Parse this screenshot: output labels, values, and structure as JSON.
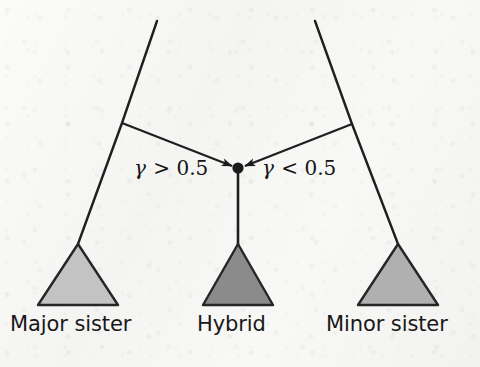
{
  "figure": {
    "background_color": "#f5f5f4",
    "ink_color": "#1b1b1b"
  },
  "network": {
    "hybrid_node": {
      "name": "hybrid-node",
      "x": 238,
      "y": 168,
      "radius": 5.5,
      "color": "#1b1b1b"
    },
    "lineages": [
      {
        "name": "major-sister-lineage",
        "points": "157,21 122,123 78,244",
        "top_x": 157,
        "top_y": 21,
        "junction_x": 122,
        "junction_y": 123,
        "tip_x": 78,
        "tip_y": 244
      },
      {
        "name": "minor-sister-lineage",
        "points": "315,21 352,124 398,244",
        "top_x": 315,
        "top_y": 21,
        "junction_x": 352,
        "junction_y": 124,
        "tip_x": 398,
        "tip_y": 244
      }
    ],
    "reticulation_edges": [
      {
        "name": "major-contribution-edge",
        "from_x": 122,
        "from_y": 123,
        "to_x": 238,
        "to_y": 168,
        "arrow": "to-hybrid"
      },
      {
        "name": "minor-contribution-edge",
        "from_x": 352,
        "from_y": 124,
        "to_x": 238,
        "to_y": 168,
        "arrow": "to-hybrid"
      }
    ],
    "hybrid_stem": {
      "name": "hybrid-stem-edge",
      "from_x": 238,
      "from_y": 168,
      "to_x": 238,
      "to_y": 246
    }
  },
  "clades": [
    {
      "name": "major-sister-clade",
      "label": "Major sister",
      "fill": "#c3c3c3",
      "stroke": "#262626",
      "apex_x": 78,
      "apex_y": 244,
      "left_x": 38,
      "right_x": 118,
      "base_y": 305,
      "label_x": 10,
      "label_y": 312
    },
    {
      "name": "hybrid-clade",
      "label": "Hybrid",
      "fill": "#8b8b8b",
      "stroke": "#262626",
      "apex_x": 238,
      "apex_y": 244,
      "left_x": 203,
      "right_x": 273,
      "base_y": 305,
      "label_x": 197,
      "label_y": 312
    },
    {
      "name": "minor-sister-clade",
      "label": "Minor sister",
      "fill": "#b0b0b0",
      "stroke": "#262626",
      "apex_x": 398,
      "apex_y": 244,
      "left_x": 358,
      "right_x": 438,
      "base_y": 305,
      "label_x": 326,
      "label_y": 312
    }
  ],
  "annotations": {
    "gamma_major": {
      "name": "gamma-major-label",
      "symbol": "γ",
      "relation": " > 0.5",
      "full_text": "γ > 0.5",
      "x": 134,
      "y": 156
    },
    "gamma_minor": {
      "name": "gamma-minor-label",
      "symbol": "γ",
      "relation": " < 0.5",
      "full_text": "γ < 0.5",
      "x": 262,
      "y": 156
    }
  }
}
